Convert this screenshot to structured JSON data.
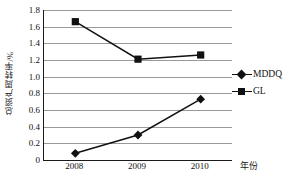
{
  "chart_data": {
    "type": "line",
    "title": "",
    "subtitle": "",
    "xlabel": "年份",
    "ylabel": "总资产周转率/%",
    "categories": [
      "2008",
      "2009",
      "2010"
    ],
    "series": [
      {
        "name": "MDDQ",
        "marker": "diamond",
        "color": "#111111",
        "values": [
          0.08,
          0.3,
          0.73
        ]
      },
      {
        "name": "GL",
        "marker": "square",
        "color": "#111111",
        "values": [
          1.66,
          1.21,
          1.26
        ]
      }
    ],
    "ylim": [
      0,
      1.8
    ],
    "yticks": [
      "1.8",
      "1.6",
      "1.4",
      "1.2",
      "1.0",
      "0.8",
      "0.6",
      "0.4",
      "0.2",
      "0"
    ],
    "ytick_values": [
      1.8,
      1.6,
      1.4,
      1.2,
      1.0,
      0.8,
      0.6,
      0.4,
      0.2,
      0
    ],
    "grid": "horizontal",
    "grid_color": "#999999",
    "legend_position": "right",
    "axis_color": "#1a1a1a",
    "background": "#ffffff"
  }
}
